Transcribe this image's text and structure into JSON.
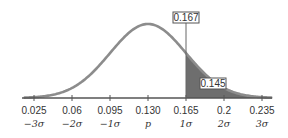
{
  "chart_data": {
    "type": "area",
    "title": "",
    "xlabel": "",
    "ylabel": "",
    "distribution": "normal",
    "mean": 0.13,
    "sd": 0.035,
    "xlim": [
      0.0165,
      0.2435
    ],
    "ticks": [
      {
        "value": 0.025,
        "label": "0.025",
        "sigma_label": "−3σ"
      },
      {
        "value": 0.06,
        "label": "0.06",
        "sigma_label": "−2σ"
      },
      {
        "value": 0.095,
        "label": "0.095",
        "sigma_label": "−1σ"
      },
      {
        "value": 0.13,
        "label": "0.130",
        "sigma_label": "p"
      },
      {
        "value": 0.165,
        "label": "0.165",
        "sigma_label": "1σ"
      },
      {
        "value": 0.2,
        "label": "0.2",
        "sigma_label": "2σ"
      },
      {
        "value": 0.235,
        "label": "0.235",
        "sigma_label": "3σ"
      }
    ],
    "shaded_region": {
      "from": 0.165,
      "to": 0.2435,
      "label": "0.145"
    },
    "marker": {
      "value": 0.165,
      "label": "0.167"
    },
    "grid": false,
    "colors": {
      "curve": "#8c8c8c",
      "shade": "#6e6e6e",
      "axis": "#555555",
      "text": "#333333"
    }
  }
}
